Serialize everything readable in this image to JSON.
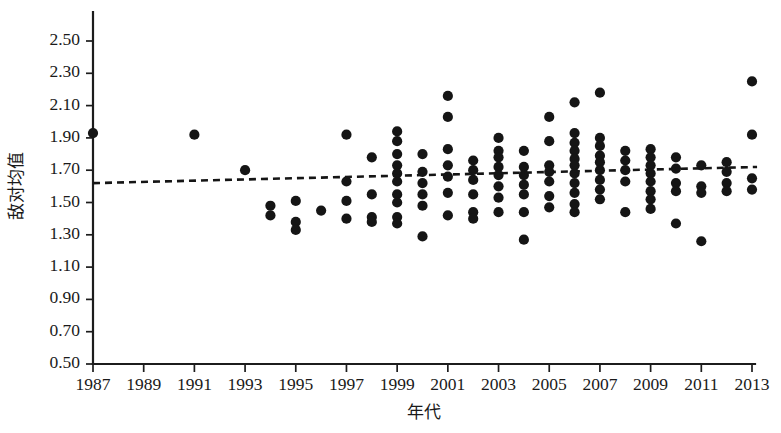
{
  "chart_data": {
    "type": "scatter",
    "title": "",
    "subtitle": "",
    "xlabel": "年代",
    "ylabel": "敌对均值",
    "xlim": [
      1986,
      2014
    ],
    "ylim": [
      0.5,
      2.5
    ],
    "xticks": [
      1987,
      1989,
      1991,
      1993,
      1995,
      1997,
      1999,
      2001,
      2003,
      2005,
      2007,
      2009,
      2011,
      2013
    ],
    "xtick_labels": [
      "1987",
      "1989",
      "1991",
      "1993",
      "1995",
      "1997",
      "1999",
      "2001",
      "2003",
      "2005",
      "2007",
      "2009",
      "2011",
      "2013"
    ],
    "yticks": [
      0.5,
      0.7,
      0.9,
      1.1,
      1.3,
      1.5,
      1.7,
      1.9,
      2.1,
      2.3,
      2.5
    ],
    "ytick_labels": [
      "0.50",
      "0.70",
      "0.90",
      "1.10",
      "1.30",
      "1.50",
      "1.70",
      "1.90",
      "2.10",
      "2.30",
      "2.50"
    ],
    "grid": false,
    "legend": null,
    "marker": "filled-circle",
    "marker_color": "#151515",
    "marker_size": 9,
    "trendline": {
      "type": "linear-dashed",
      "color": "#151515",
      "style": "dashed",
      "x_start": 1987,
      "y_start": 1.62,
      "x_end": 2013.2,
      "y_end": 1.72
    },
    "series": [
      {
        "name": "敌对均值",
        "points": [
          [
            1987.0,
            1.93
          ],
          [
            1991.0,
            1.92
          ],
          [
            1993.0,
            1.7
          ],
          [
            1994.0,
            1.48
          ],
          [
            1994.0,
            1.42
          ],
          [
            1995.0,
            1.51
          ],
          [
            1995.0,
            1.38
          ],
          [
            1995.0,
            1.33
          ],
          [
            1996.0,
            1.45
          ],
          [
            1997.0,
            1.92
          ],
          [
            1997.0,
            1.63
          ],
          [
            1997.0,
            1.51
          ],
          [
            1997.0,
            1.4
          ],
          [
            1998.0,
            1.78
          ],
          [
            1998.0,
            1.55
          ],
          [
            1998.0,
            1.41
          ],
          [
            1998.0,
            1.38
          ],
          [
            1999.0,
            1.94
          ],
          [
            1999.0,
            1.88
          ],
          [
            1999.0,
            1.8
          ],
          [
            1999.0,
            1.73
          ],
          [
            1999.0,
            1.68
          ],
          [
            1999.0,
            1.63
          ],
          [
            1999.0,
            1.55
          ],
          [
            1999.0,
            1.5
          ],
          [
            1999.0,
            1.41
          ],
          [
            1999.0,
            1.37
          ],
          [
            2000.0,
            1.8
          ],
          [
            2000.0,
            1.69
          ],
          [
            2000.0,
            1.62
          ],
          [
            2000.0,
            1.55
          ],
          [
            2000.0,
            1.48
          ],
          [
            2000.0,
            1.29
          ],
          [
            2001.0,
            2.16
          ],
          [
            2001.0,
            2.03
          ],
          [
            2001.0,
            1.83
          ],
          [
            2001.0,
            1.73
          ],
          [
            2001.0,
            1.66
          ],
          [
            2001.0,
            1.56
          ],
          [
            2001.0,
            1.42
          ],
          [
            2002.0,
            1.76
          ],
          [
            2002.0,
            1.7
          ],
          [
            2002.0,
            1.64
          ],
          [
            2002.0,
            1.55
          ],
          [
            2002.0,
            1.44
          ],
          [
            2002.0,
            1.4
          ],
          [
            2003.0,
            1.9
          ],
          [
            2003.0,
            1.82
          ],
          [
            2003.0,
            1.78
          ],
          [
            2003.0,
            1.72
          ],
          [
            2003.0,
            1.67
          ],
          [
            2003.0,
            1.6
          ],
          [
            2003.0,
            1.53
          ],
          [
            2003.0,
            1.44
          ],
          [
            2004.0,
            1.82
          ],
          [
            2004.0,
            1.72
          ],
          [
            2004.0,
            1.67
          ],
          [
            2004.0,
            1.61
          ],
          [
            2004.0,
            1.55
          ],
          [
            2004.0,
            1.44
          ],
          [
            2004.0,
            1.27
          ],
          [
            2005.0,
            2.03
          ],
          [
            2005.0,
            1.88
          ],
          [
            2005.0,
            1.73
          ],
          [
            2005.0,
            1.69
          ],
          [
            2005.0,
            1.63
          ],
          [
            2005.0,
            1.54
          ],
          [
            2005.0,
            1.47
          ],
          [
            2006.0,
            2.12
          ],
          [
            2006.0,
            1.93
          ],
          [
            2006.0,
            1.87
          ],
          [
            2006.0,
            1.82
          ],
          [
            2006.0,
            1.77
          ],
          [
            2006.0,
            1.73
          ],
          [
            2006.0,
            1.68
          ],
          [
            2006.0,
            1.62
          ],
          [
            2006.0,
            1.56
          ],
          [
            2006.0,
            1.49
          ],
          [
            2006.0,
            1.44
          ],
          [
            2007.0,
            2.18
          ],
          [
            2007.0,
            1.9
          ],
          [
            2007.0,
            1.85
          ],
          [
            2007.0,
            1.79
          ],
          [
            2007.0,
            1.75
          ],
          [
            2007.0,
            1.7
          ],
          [
            2007.0,
            1.64
          ],
          [
            2007.0,
            1.58
          ],
          [
            2007.0,
            1.52
          ],
          [
            2008.0,
            1.82
          ],
          [
            2008.0,
            1.76
          ],
          [
            2008.0,
            1.7
          ],
          [
            2008.0,
            1.63
          ],
          [
            2008.0,
            1.44
          ],
          [
            2009.0,
            1.83
          ],
          [
            2009.0,
            1.78
          ],
          [
            2009.0,
            1.73
          ],
          [
            2009.0,
            1.68
          ],
          [
            2009.0,
            1.63
          ],
          [
            2009.0,
            1.57
          ],
          [
            2009.0,
            1.52
          ],
          [
            2009.0,
            1.46
          ],
          [
            2010.0,
            1.78
          ],
          [
            2010.0,
            1.71
          ],
          [
            2010.0,
            1.62
          ],
          [
            2010.0,
            1.57
          ],
          [
            2010.0,
            1.37
          ],
          [
            2011.0,
            1.73
          ],
          [
            2011.0,
            1.6
          ],
          [
            2011.0,
            1.56
          ],
          [
            2011.0,
            1.26
          ],
          [
            2012.0,
            1.75
          ],
          [
            2012.0,
            1.69
          ],
          [
            2012.0,
            1.62
          ],
          [
            2012.0,
            1.57
          ],
          [
            2013.0,
            2.25
          ],
          [
            2013.0,
            1.92
          ],
          [
            2013.0,
            1.65
          ],
          [
            2013.0,
            1.58
          ]
        ]
      }
    ]
  },
  "axes": {
    "y_axis_name": "敌对均值",
    "x_axis_name": "年代"
  }
}
